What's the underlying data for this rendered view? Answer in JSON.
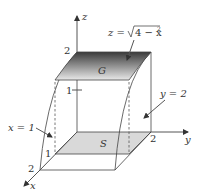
{
  "figure": {
    "type": "3d-region-diagram",
    "axes": {
      "x": {
        "label": "x",
        "ticks": [
          "1",
          "2"
        ]
      },
      "y": {
        "label": "y",
        "ticks": [
          "2"
        ]
      },
      "z": {
        "label": "z",
        "ticks": [
          "1",
          "2"
        ]
      }
    },
    "surfaces": {
      "top": {
        "label": "G",
        "equation_lhs": "z =",
        "equation_radicand": "4 − x",
        "equation_exp": "2"
      },
      "base": {
        "label": "S"
      }
    },
    "plane_labels": {
      "x_plane": "x = 1",
      "y_plane": "y = 2"
    },
    "colors": {
      "surface_dark": "#3a3a3a",
      "surface_light": "#e6e6e6",
      "base_fill": "#d9d9d9",
      "lines": "#444444"
    }
  }
}
